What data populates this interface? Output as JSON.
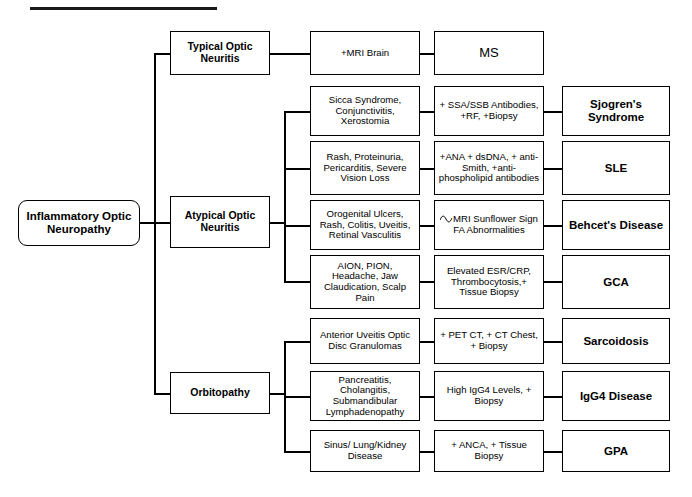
{
  "diagram": {
    "title_rule": "",
    "root": {
      "label": "Inflammatory Optic Neuropathy"
    },
    "branches": [
      {
        "id": "typical",
        "label": "Typical Optic Neuritis"
      },
      {
        "id": "atypical",
        "label": "Atypical Optic Neuritis"
      },
      {
        "id": "orbitopathy",
        "label": "Orbitopathy"
      }
    ],
    "rows": [
      {
        "symptoms": "+MRI Brain",
        "tests": "MS",
        "diagnosis": "",
        "note": "typical-branch-row"
      },
      {
        "symptoms": "Sicca Syndrome, Conjunctivitis, Xerostomia",
        "tests": "+ SSA/SSB Antibodies, +RF, +Biopsy",
        "diagnosis": "Sjogren's Syndrome"
      },
      {
        "symptoms": "Rash, Proteinuria, Pericarditis, Severe Vision Loss",
        "tests": "+ANA + dsDNA, + anti-Smith, +anti-phospholipid antibodies",
        "diagnosis": "SLE"
      },
      {
        "symptoms": "Orogenital Ulcers, Rash, Colitis, Uveitis, Retinal Vasculitis",
        "tests": "MRI Sunflower Sign FA Abnormalities",
        "diagnosis": "Behcet's Disease"
      },
      {
        "symptoms": "AION, PION, Headache, Jaw Claudication, Scalp Pain",
        "tests": "Elevated ESR/CRP, Thrombocytosis,+ Tissue Biopsy",
        "diagnosis": "GCA"
      },
      {
        "symptoms": "Anterior Uveitis Optic Disc Granulomas",
        "tests": "+ PET CT, + CT Chest, + Biopsy",
        "diagnosis": "Sarcoidosis"
      },
      {
        "symptoms": "Pancreatitis, Cholangitis, Submandibular Lymphadenopathy",
        "tests": "High IgG4 Levels, + Biopsy",
        "diagnosis": "IgG4 Disease"
      },
      {
        "symptoms": "Sinus/ Lung/Kidney Disease",
        "tests": "+ ANCA, + Tissue Biopsy",
        "diagnosis": "GPA"
      }
    ],
    "typical_row": {
      "symptoms": "+MRI Brain",
      "outcome": "MS"
    }
  }
}
